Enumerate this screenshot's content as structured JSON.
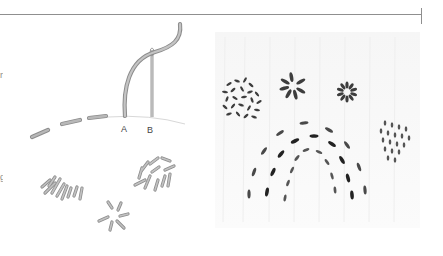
{
  "figure": {
    "top_rule_color": "#8f8f8f",
    "left_margin_fragments": [
      "n",
      "g"
    ],
    "illustration": {
      "labels": {
        "point_a": "A",
        "point_b": "B"
      },
      "thread_color": "#b5b5b5",
      "thread_outline": "#8c8c8c",
      "groups": [
        "running-stitch-arc",
        "needle-and-thread",
        "seed-stitch-cluster-left",
        "seed-stitch-cluster-right",
        "star-stitch"
      ]
    },
    "photo": {
      "stitch_color": "#3a3a3a",
      "elements": [
        "seed-stitch-patch-left",
        "star-flower",
        "ring-flower",
        "seed-stitch-patch-right",
        "triple-rainbow-arcs"
      ]
    }
  }
}
